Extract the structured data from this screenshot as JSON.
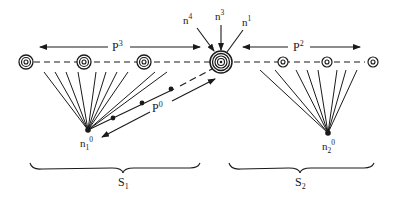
{
  "diagram": {
    "colors": {
      "ink": "#1a1a1a",
      "background": "#ffffff"
    },
    "labels": {
      "p3": {
        "base": "P",
        "sup": "3"
      },
      "p2": {
        "base": "P",
        "sup": "2"
      },
      "p0": {
        "base": "P",
        "sup": "0"
      },
      "n4": {
        "base": "n",
        "sup": "4"
      },
      "n3": {
        "base": "n",
        "sup": "3"
      },
      "n1": {
        "base": "n",
        "sup": "1"
      },
      "n10": {
        "base": "n",
        "sub": "1",
        "sup": "0"
      },
      "n20": {
        "base": "n",
        "sub": "2",
        "sup": "0"
      },
      "s1": {
        "base": "S",
        "sub": "1"
      },
      "s2": {
        "base": "S",
        "sub": "2"
      }
    },
    "targets_left": [
      26,
      84,
      144
    ],
    "target_center": 221,
    "targets_right": [
      283,
      327,
      373
    ],
    "baseline_y": 62,
    "sources": [
      {
        "name": "n1^0",
        "x": 88,
        "y": 130
      },
      {
        "name": "n2^0",
        "x": 328,
        "y": 133
      }
    ],
    "groups": [
      "S1",
      "S2"
    ]
  }
}
